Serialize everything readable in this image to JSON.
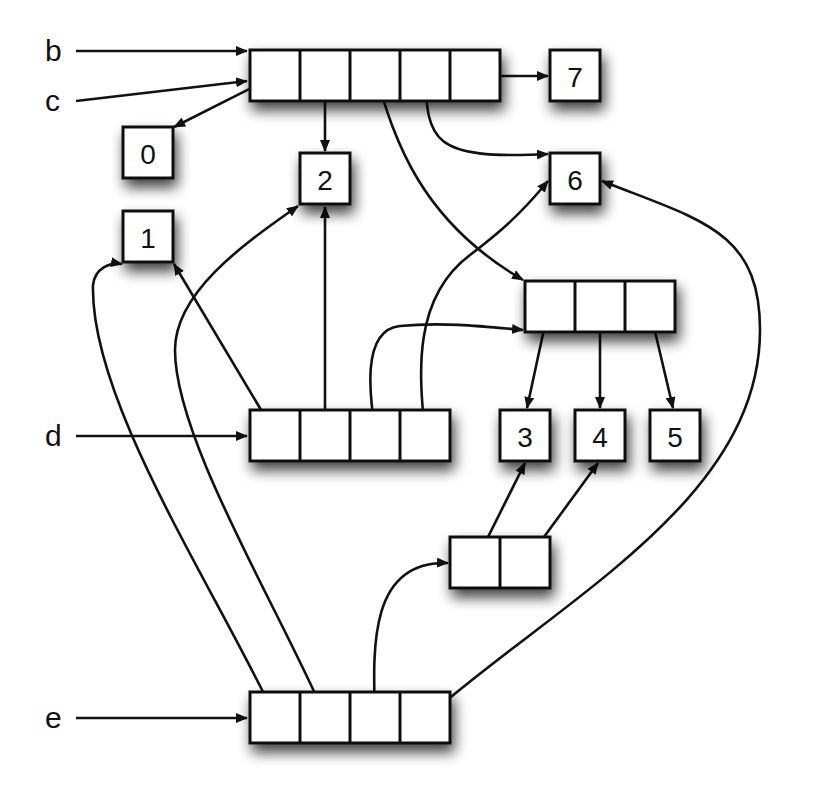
{
  "diagram": {
    "type": "memory-reference-graph",
    "variables": [
      {
        "id": "b",
        "label": "b",
        "x": 45,
        "y": 51,
        "target": "arrA",
        "arrow_y": 51
      },
      {
        "id": "c",
        "label": "c",
        "x": 45,
        "y": 101,
        "target": "arrA",
        "arrow_y": 81
      },
      {
        "id": "d",
        "label": "d",
        "x": 45,
        "y": 436,
        "target": "arrD",
        "arrow_y": 436
      },
      {
        "id": "e",
        "label": "e",
        "x": 45,
        "y": 718,
        "target": "arrE",
        "arrow_y": 718
      }
    ],
    "arrays": [
      {
        "id": "arrA",
        "x": 250,
        "y": 50,
        "cells": 5,
        "cell_w": 50,
        "h": 51
      },
      {
        "id": "arrB",
        "x": 525,
        "y": 281,
        "cells": 3,
        "cell_w": 50,
        "h": 51
      },
      {
        "id": "arrD",
        "x": 250,
        "y": 410,
        "cells": 4,
        "cell_w": 50,
        "h": 51
      },
      {
        "id": "arrP",
        "x": 450,
        "y": 537,
        "cells": 2,
        "cell_w": 50,
        "h": 51
      },
      {
        "id": "arrE",
        "x": 250,
        "y": 692,
        "cells": 4,
        "cell_w": 50,
        "h": 51
      }
    ],
    "values": [
      {
        "id": "v0",
        "label": "0",
        "x": 123,
        "y": 127
      },
      {
        "id": "v1",
        "label": "1",
        "x": 123,
        "y": 211
      },
      {
        "id": "v2",
        "label": "2",
        "x": 300,
        "y": 153
      },
      {
        "id": "v3",
        "label": "3",
        "x": 500,
        "y": 410
      },
      {
        "id": "v4",
        "label": "4",
        "x": 575,
        "y": 410
      },
      {
        "id": "v5",
        "label": "5",
        "x": 650,
        "y": 410
      },
      {
        "id": "v6",
        "label": "6",
        "x": 550,
        "y": 153
      },
      {
        "id": "v7",
        "label": "7",
        "x": 550,
        "y": 50
      }
    ],
    "references": [
      {
        "from": "arrA[0]",
        "to": "0",
        "path": "M275,76 L174,127"
      },
      {
        "from": "arrA[1]",
        "to": "2",
        "path": "M325,76 L325,151"
      },
      {
        "from": "arrA[2]",
        "to": "arrB",
        "path": "M376,76 C395,140 420,220 523,280"
      },
      {
        "from": "arrA[3]",
        "to": "6",
        "path": "M425,76 C428,140 430,160 548,154"
      },
      {
        "from": "arrA[4]",
        "to": "7",
        "path": "M475,76 L548,76"
      },
      {
        "from": "arrB[0]",
        "to": "3",
        "path": "M549,306 L527,408"
      },
      {
        "from": "arrB[1]",
        "to": "4",
        "path": "M600,306 L600,408"
      },
      {
        "from": "arrB[2]",
        "to": "5",
        "path": "M649,306 L673,408"
      },
      {
        "from": "arrD[0]",
        "to": "1",
        "path": "M276,435 L174,264"
      },
      {
        "from": "arrD[1]",
        "to": "2",
        "path": "M325,435 L325,207"
      },
      {
        "from": "arrD[2]",
        "to": "arrB",
        "path": "M376,435 C370,400 360,330 400,326 C440,322 480,326 523,330"
      },
      {
        "from": "arrD[3]",
        "to": "6",
        "path": "M425,435 C420,380 410,300 470,255 C500,232 520,215 548,181"
      },
      {
        "from": "arrP[0]",
        "to": "3",
        "path": "M475,563 L525,463"
      },
      {
        "from": "arrP[1]",
        "to": "4",
        "path": "M525,563 L598,463"
      },
      {
        "from": "arrE[0]",
        "to": "1",
        "path": "M276,718 C210,580 90,400 93,285 C95,268 110,262 122,264"
      },
      {
        "from": "arrE[1]",
        "to": "2",
        "path": "M326,718 C280,610 175,440 175,350 C175,290 250,240 298,206"
      },
      {
        "from": "arrE[2]",
        "to": "arrP",
        "path": "M375,718 C373,650 368,560 448,563"
      },
      {
        "from": "arrE[3]",
        "to": "6",
        "path": "M426,718 C560,600 760,500 760,330 C760,230 700,220 602,181"
      }
    ]
  }
}
